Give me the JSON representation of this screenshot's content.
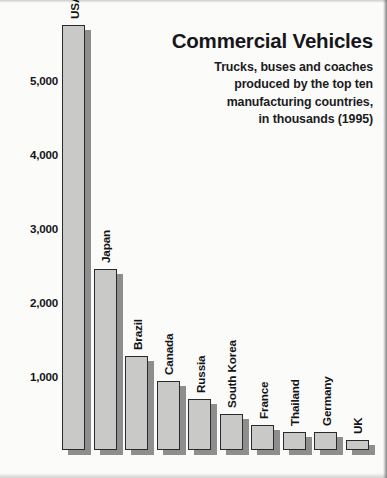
{
  "header": {
    "title": "Commercial Vehicles",
    "subtitle_lines": [
      "Trucks, buses and coaches",
      "produced by the top ten",
      "manufacturing countries,",
      "in thousands (1995)"
    ]
  },
  "axis": {
    "y_ticks": [
      "5,000",
      "4,000",
      "3,000",
      "2,000",
      "1,000"
    ]
  },
  "chart_data": {
    "type": "bar",
    "title": "Commercial Vehicles",
    "subtitle": "Trucks, buses and coaches produced by the top ten manufacturing countries, in thousands (1995)",
    "xlabel": "",
    "ylabel": "",
    "ylim": [
      0,
      5800
    ],
    "grid": false,
    "legend": "none",
    "units": "thousands",
    "year": 1995,
    "ytick_values": [
      5000,
      4000,
      3000,
      2000,
      1000
    ],
    "ytick_labels": [
      "5,000",
      "4,000",
      "3,000",
      "2,000",
      "1,000"
    ],
    "categories": [
      "USA",
      "Japan",
      "Brazil",
      "Canada",
      "Russia",
      "South Korea",
      "France",
      "Thailand",
      "Germany",
      "UK"
    ],
    "values": [
      5750,
      2450,
      1270,
      930,
      690,
      480,
      340,
      250,
      240,
      140
    ],
    "bars": [
      {
        "label": "USA",
        "value": 5750
      },
      {
        "label": "Japan",
        "value": 2450
      },
      {
        "label": "Brazil",
        "value": 1270
      },
      {
        "label": "Canada",
        "value": 930
      },
      {
        "label": "Russia",
        "value": 690
      },
      {
        "label": "South Korea",
        "value": 480
      },
      {
        "label": "France",
        "value": 340
      },
      {
        "label": "Thailand",
        "value": 250
      },
      {
        "label": "Germany",
        "value": 240
      },
      {
        "label": "UK",
        "value": 140
      }
    ],
    "colors": {
      "bar_face": "#c9c9c7",
      "bar_outline": "#2a2a2c",
      "bar_shadow": "#8e8e8e",
      "background": "#fbfbfa",
      "text": "#141417"
    }
  }
}
